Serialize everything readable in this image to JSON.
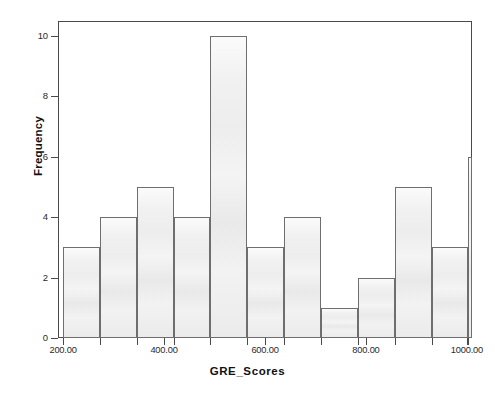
{
  "chart_data": {
    "type": "bar",
    "title": "",
    "subtitle": "",
    "xlabel": "GRE_Scores",
    "ylabel": "Frequency",
    "xlim": [
      190,
      1010
    ],
    "ylim": [
      0,
      10.5
    ],
    "grid": false,
    "legend": null,
    "bin_width": 73,
    "x_tick_labels": [
      "200.00",
      "400.00",
      "600.00",
      "800.00",
      "1000.00"
    ],
    "x_tick_values": [
      200,
      400,
      600,
      800,
      1000
    ],
    "y_tick_labels": [
      "0",
      "2",
      "4",
      "6",
      "8",
      "10"
    ],
    "y_tick_values": [
      0,
      2,
      4,
      6,
      8,
      10
    ],
    "bins": [
      {
        "left": 200,
        "right": 273,
        "frequency": 3
      },
      {
        "left": 273,
        "right": 346,
        "frequency": 4
      },
      {
        "left": 346,
        "right": 419,
        "frequency": 5
      },
      {
        "left": 419,
        "right": 492,
        "frequency": 4
      },
      {
        "left": 492,
        "right": 565,
        "frequency": 10
      },
      {
        "left": 565,
        "right": 638,
        "frequency": 3
      },
      {
        "left": 638,
        "right": 711,
        "frequency": 4
      },
      {
        "left": 711,
        "right": 784,
        "frequency": 1
      },
      {
        "left": 784,
        "right": 857,
        "frequency": 2
      },
      {
        "left": 857,
        "right": 930,
        "frequency": 5
      },
      {
        "left": 930,
        "right": 1003,
        "frequency": 3
      },
      {
        "left": 1003,
        "right": 1076,
        "frequency": 6
      }
    ],
    "categories": [
      "200-273",
      "273-346",
      "346-419",
      "419-492",
      "492-565",
      "565-638",
      "638-711",
      "711-784",
      "784-857",
      "857-930",
      "930-1003",
      "1003-1076"
    ],
    "values": [
      3,
      4,
      5,
      4,
      10,
      3,
      4,
      1,
      2,
      5,
      3,
      6
    ],
    "colors": {
      "bar_fill": "#efefef",
      "bar_border": "#6e6e6e",
      "axis": "#4a4a4a",
      "text": "#111111",
      "background": "#ffffff"
    }
  }
}
